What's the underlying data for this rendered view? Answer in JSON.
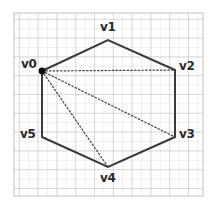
{
  "figure": {
    "type": "geometry-diagram",
    "background_color": "#ffffff",
    "grid": {
      "visible": true,
      "color": "#c9c9c9",
      "minor_color": "#dcdcdc",
      "cell_size": 9.4,
      "left": 14,
      "top": 13,
      "right": 203,
      "bottom": 196,
      "columns": 20,
      "rows": 19
    },
    "polygon": {
      "name": "hexagon",
      "sides": 6,
      "stroke_color": "#3a3a3a",
      "stroke_width": 2,
      "fill": "none",
      "points": "42,71 108,40 175,70 175,137 108,167 42,137"
    },
    "vertices": [
      {
        "id": "v0",
        "label": "v0",
        "x": 42,
        "y": 71,
        "label_x": 21,
        "label_y": 58,
        "marked": true
      },
      {
        "id": "v1",
        "label": "v1",
        "x": 108,
        "y": 40,
        "label_x": 100,
        "label_y": 21,
        "marked": false
      },
      {
        "id": "v2",
        "label": "v2",
        "x": 175,
        "y": 70,
        "label_x": 179,
        "label_y": 60,
        "marked": false
      },
      {
        "id": "v3",
        "label": "v3",
        "x": 175,
        "y": 137,
        "label_x": 179,
        "label_y": 128,
        "marked": false
      },
      {
        "id": "v4",
        "label": "v4",
        "x": 108,
        "y": 167,
        "label_x": 100,
        "label_y": 172,
        "marked": false
      },
      {
        "id": "v5",
        "label": "v5",
        "x": 42,
        "y": 137,
        "label_x": 20,
        "label_y": 128,
        "marked": false
      }
    ],
    "vertex_marker": {
      "at": "v0",
      "shape": "filled-circle",
      "radius": 3.4,
      "color": "#111111"
    },
    "diagonals": [
      {
        "id": "d0-2",
        "from": "v0",
        "to": "v2",
        "x1": 42,
        "y1": 71,
        "x2": 175,
        "y2": 70,
        "style": "dotted",
        "color": "#444444",
        "width": 1.2
      },
      {
        "id": "d0-3",
        "from": "v0",
        "to": "v3",
        "x1": 42,
        "y1": 71,
        "x2": 175,
        "y2": 137,
        "style": "dotted",
        "color": "#444444",
        "width": 1.2
      },
      {
        "id": "d0-4",
        "from": "v0",
        "to": "v4",
        "x1": 42,
        "y1": 71,
        "x2": 108,
        "y2": 167,
        "style": "dotted",
        "color": "#444444",
        "width": 1.2
      }
    ]
  }
}
